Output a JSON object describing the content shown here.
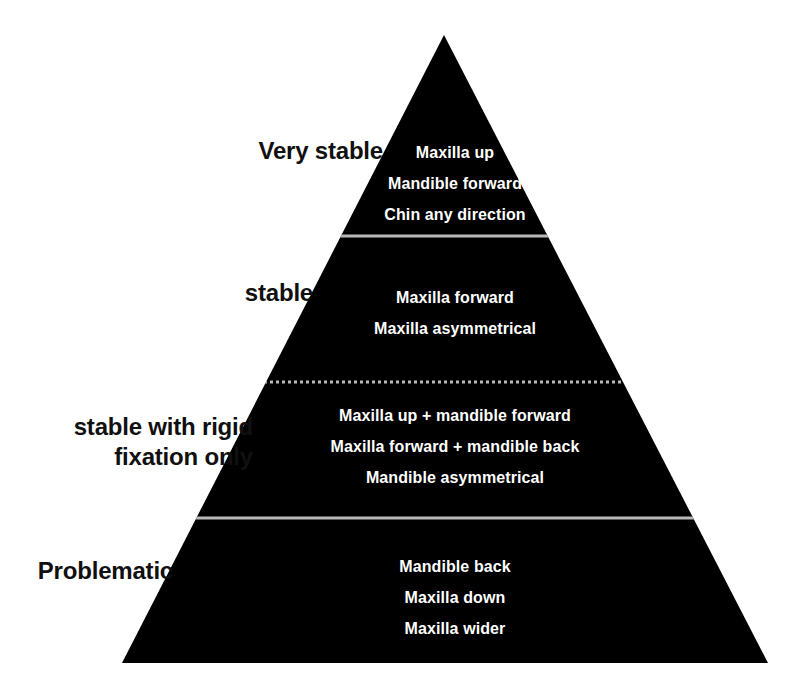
{
  "figure": {
    "kind": "pyramid-diagram",
    "background_color": "#ffffff",
    "body_color": "#000000",
    "item_text_color": "#ffffff",
    "label_text_color": "#101010",
    "divider_color": "#b9b9b9"
  },
  "pyramid": {
    "apex": {
      "x": 444,
      "y": 35
    },
    "base_left": {
      "x": 122,
      "y": 663
    },
    "base_right": {
      "x": 768,
      "y": 663
    },
    "dividers": [
      {
        "y": 236,
        "style": "solid"
      },
      {
        "y": 382,
        "style": "dotted"
      },
      {
        "y": 518,
        "style": "solid"
      }
    ]
  },
  "tiers": [
    {
      "label": "Very stable",
      "items": [
        "Maxilla up",
        "Mandible forward",
        "Chin any direction"
      ]
    },
    {
      "label": "stable",
      "items": [
        "Maxilla forward",
        "Maxilla asymmetrical"
      ]
    },
    {
      "label": "stable with rigid\nfixation only",
      "items": [
        "Maxilla up + mandible forward",
        "Maxilla forward + mandible back",
        "Mandible asymmetrical"
      ]
    },
    {
      "label": "Problematic",
      "items": [
        "Mandible back",
        "Maxilla down",
        "Maxilla wider"
      ]
    }
  ]
}
